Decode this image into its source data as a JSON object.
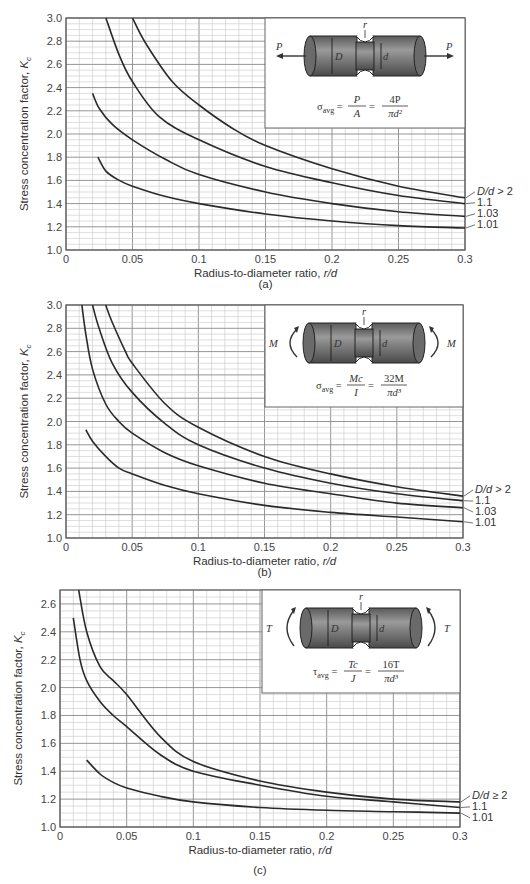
{
  "chart_data": [
    {
      "type": "line",
      "id": "a",
      "caption": "(a)",
      "loading": "axial",
      "title": "",
      "xlabel": "Radius-to-diameter ratio, r/d",
      "ylabel": "Stress concentration factor, Kc",
      "xlim": [
        0,
        0.3
      ],
      "ylim": [
        1.0,
        3.0
      ],
      "xticks": [
        "0",
        "0.05",
        "0.1",
        "0.15",
        "0.2",
        "0.25",
        "0.3"
      ],
      "yticks": [
        "1.0",
        "1.2",
        "1.4",
        "1.6",
        "1.8",
        "2.0",
        "2.2",
        "2.4",
        "2.6",
        "2.8",
        "3.0"
      ],
      "grid": true,
      "legend_position": "right-end-of-curves",
      "inset": {
        "load_symbol": "P",
        "labels": [
          "r",
          "D",
          "d"
        ],
        "formula_lhs": "σavg",
        "formula_mid": "P/A",
        "formula_rhs": "4P/(πd²)"
      },
      "series": [
        {
          "name": "D/d > 2",
          "x": [
            0.05,
            0.06,
            0.08,
            0.1,
            0.125,
            0.15,
            0.2,
            0.25,
            0.3
          ],
          "y": [
            3.0,
            2.78,
            2.45,
            2.25,
            2.05,
            1.9,
            1.7,
            1.55,
            1.45
          ]
        },
        {
          "name": "1.1",
          "x": [
            0.03,
            0.04,
            0.05,
            0.07,
            0.1,
            0.15,
            0.2,
            0.25,
            0.3
          ],
          "y": [
            3.0,
            2.68,
            2.45,
            2.15,
            1.95,
            1.72,
            1.58,
            1.47,
            1.4
          ]
        },
        {
          "name": "1.03",
          "x": [
            0.02,
            0.025,
            0.035,
            0.05,
            0.075,
            0.1,
            0.15,
            0.2,
            0.25,
            0.3
          ],
          "y": [
            2.35,
            2.22,
            2.08,
            1.95,
            1.78,
            1.65,
            1.5,
            1.4,
            1.33,
            1.29
          ]
        },
        {
          "name": "1.01",
          "x": [
            0.024,
            0.03,
            0.04,
            0.05,
            0.075,
            0.1,
            0.15,
            0.2,
            0.25,
            0.3
          ],
          "y": [
            1.8,
            1.68,
            1.6,
            1.55,
            1.46,
            1.4,
            1.31,
            1.25,
            1.21,
            1.19
          ]
        }
      ]
    },
    {
      "type": "line",
      "id": "b",
      "caption": "(b)",
      "loading": "bending",
      "title": "",
      "xlabel": "Radius-to-diameter ratio, r/d",
      "ylabel": "Stress concentration factor, Kc",
      "xlim": [
        0,
        0.3
      ],
      "ylim": [
        1.0,
        3.0
      ],
      "xticks": [
        "0",
        "0.05",
        "0.1",
        "0.15",
        "0.2",
        "0.25",
        "0.3"
      ],
      "yticks": [
        "1.0",
        "1.2",
        "1.4",
        "1.6",
        "1.8",
        "2.0",
        "2.2",
        "2.4",
        "2.6",
        "2.8",
        "3.0"
      ],
      "grid": true,
      "legend_position": "right-end-of-curves",
      "inset": {
        "load_symbol": "M",
        "labels": [
          "r",
          "D",
          "d"
        ],
        "formula_lhs": "σavg",
        "formula_mid": "Mc/I",
        "formula_rhs": "32M/(πd³)"
      },
      "series": [
        {
          "name": "D/d > 2",
          "x": [
            0.03,
            0.035,
            0.045,
            0.05,
            0.075,
            0.1,
            0.15,
            0.2,
            0.25,
            0.3
          ],
          "y": [
            3.0,
            2.85,
            2.6,
            2.5,
            2.15,
            1.95,
            1.7,
            1.55,
            1.44,
            1.36
          ]
        },
        {
          "name": "1.1",
          "x": [
            0.02,
            0.025,
            0.035,
            0.05,
            0.075,
            0.1,
            0.15,
            0.2,
            0.25,
            0.3
          ],
          "y": [
            3.0,
            2.8,
            2.5,
            2.25,
            1.98,
            1.8,
            1.6,
            1.47,
            1.38,
            1.32
          ]
        },
        {
          "name": "1.03",
          "x": [
            0.012,
            0.015,
            0.02,
            0.03,
            0.04,
            0.05,
            0.075,
            0.1,
            0.15,
            0.2,
            0.25,
            0.3
          ],
          "y": [
            3.0,
            2.75,
            2.45,
            2.15,
            2.0,
            1.9,
            1.73,
            1.62,
            1.47,
            1.38,
            1.3,
            1.26
          ]
        },
        {
          "name": "1.01",
          "x": [
            0.015,
            0.02,
            0.03,
            0.04,
            0.05,
            0.075,
            0.1,
            0.15,
            0.2,
            0.25,
            0.3
          ],
          "y": [
            1.93,
            1.83,
            1.7,
            1.6,
            1.55,
            1.45,
            1.38,
            1.28,
            1.22,
            1.18,
            1.14
          ]
        }
      ]
    },
    {
      "type": "line",
      "id": "c",
      "caption": "(c)",
      "loading": "torsion",
      "title": "",
      "xlabel": "Radius-to-diameter ratio, r/d",
      "ylabel": "Stress concentration factor, Kc",
      "xlim": [
        0,
        0.3
      ],
      "ylim": [
        1.0,
        2.7
      ],
      "xticks": [
        "0",
        "0.05",
        "0.1",
        "0.15",
        "0.2",
        "0.25",
        "0.3"
      ],
      "yticks": [
        "1.0",
        "1.2",
        "1.4",
        "1.6",
        "1.8",
        "2.0",
        "2.2",
        "2.4",
        "2.6"
      ],
      "grid": true,
      "legend_position": "right-end-of-curves",
      "inset": {
        "load_symbol": "T",
        "labels": [
          "r",
          "D",
          "d"
        ],
        "formula_lhs": "τavg",
        "formula_mid": "Tc/J",
        "formula_rhs": "16T/(πd³)"
      },
      "series": [
        {
          "name": "D/d ≥ 2",
          "x": [
            0.014,
            0.02,
            0.03,
            0.04,
            0.05,
            0.075,
            0.1,
            0.15,
            0.2,
            0.25,
            0.3
          ],
          "y": [
            2.7,
            2.4,
            2.15,
            2.05,
            1.95,
            1.65,
            1.47,
            1.33,
            1.25,
            1.2,
            1.18
          ]
        },
        {
          "name": "1.1",
          "x": [
            0.01,
            0.015,
            0.02,
            0.03,
            0.04,
            0.05,
            0.075,
            0.1,
            0.15,
            0.2,
            0.25,
            0.3
          ],
          "y": [
            2.5,
            2.2,
            2.05,
            1.9,
            1.8,
            1.72,
            1.52,
            1.4,
            1.3,
            1.22,
            1.18,
            1.14
          ]
        },
        {
          "name": "1.01",
          "x": [
            0.02,
            0.03,
            0.04,
            0.05,
            0.075,
            0.1,
            0.15,
            0.2,
            0.25,
            0.3
          ],
          "y": [
            1.48,
            1.38,
            1.32,
            1.28,
            1.22,
            1.18,
            1.14,
            1.12,
            1.11,
            1.1
          ]
        }
      ]
    }
  ],
  "labels": {
    "xlabel": "Radius-to-diameter ratio, ",
    "xlabel_var": "r/d",
    "ylabel": "Stress concentration factor, ",
    "ylabel_var": "K",
    "ylabel_sub": "c",
    "caption_a": "(a)",
    "caption_b": "(b)",
    "caption_c": "(c)"
  }
}
